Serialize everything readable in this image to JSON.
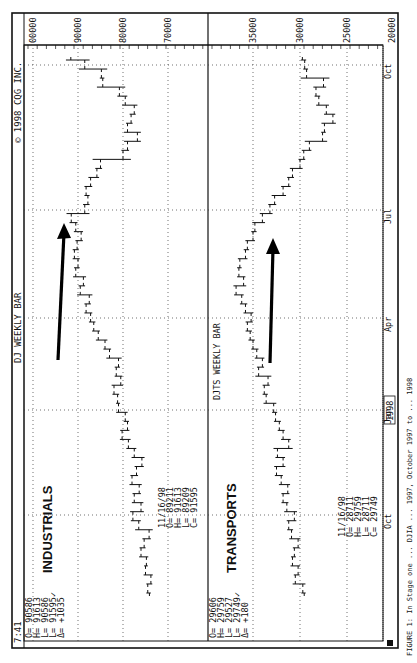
{
  "header": {
    "time": "7:41",
    "title": "DJ WEEKLY BAR",
    "copyright": "© 1998 CQG INC.",
    "industrials_quote": [
      "O= 90586",
      "H= 91613",
      "L= 90586",
      "L= 91595✓",
      "Δ= +1035"
    ],
    "transports_quote": [
      "O= 29606",
      "H= 29759",
      "L= 29527",
      "L= 29749✓",
      "Δ= +180"
    ]
  },
  "panels": {
    "industrials": {
      "label": "INDUSTRIALS",
      "date_box": [
        "11/16/98",
        "O= 89211",
        "H= 91613",
        "L= 89209",
        "C= 91595"
      ]
    },
    "transports": {
      "label": "TRANSPORTS",
      "sublabel": "DJTS WEEKLY BAR",
      "date_box": [
        "11/16/98",
        "O= 28711",
        "H= 29759",
        "L= 28711",
        "C= 29749"
      ]
    }
  },
  "caption": "FIGURE 1: In Stage one ... DJIA ... 1997, October 1997 to ... 1998",
  "chart_data": [
    {
      "type": "bar",
      "subtype": "ohlc_weekly",
      "title": "DJ WEEKLY BAR — INDUSTRIALS",
      "xlabel": "",
      "ylabel": "",
      "x_ticks": [
        "Oct",
        "Jan 1998",
        "Apr",
        "Jul",
        "Oct"
      ],
      "y_ticks": [
        100000,
        90000,
        80000,
        70000
      ],
      "ylim": [
        60000,
        102000
      ],
      "grid": true,
      "annotation": "arrow pointing up along rising trend, Apr-Jul 1998",
      "last_bar": {
        "date": "11/16/98",
        "open": 89211,
        "high": 91613,
        "low": 89209,
        "close": 91595
      },
      "weeks": 60,
      "close_series_approx": [
        74500,
        73800,
        75000,
        74800,
        76000,
        75300,
        74200,
        76500,
        77800,
        76000,
        77500,
        76400,
        78000,
        77000,
        75800,
        77500,
        78800,
        80200,
        79000,
        79500,
        81000,
        81200,
        82000,
        80500,
        81500,
        81000,
        83000,
        84000,
        85500,
        86500,
        87200,
        88200,
        87500,
        89500,
        88800,
        90500,
        90000,
        90800,
        90200,
        89300,
        90500,
        91500,
        88500,
        87800,
        88200,
        87200,
        85800,
        85000,
        80000,
        79000,
        76800,
        79000,
        78200,
        77500,
        79500,
        80800,
        84500,
        84800,
        88500,
        91595
      ]
    },
    {
      "type": "bar",
      "subtype": "ohlc_weekly",
      "title": "DJTS WEEKLY BAR — TRANSPORTS",
      "xlabel": "",
      "ylabel": "",
      "x_ticks": [
        "Oct",
        "Jan 1998",
        "Apr",
        "Jul",
        "Oct"
      ],
      "y_ticks": [
        35000,
        30000,
        25000,
        20000
      ],
      "ylim": [
        19000,
        38000
      ],
      "grid": true,
      "annotation": "arrow pointing up along rising trend, Apr-Jul 1998",
      "last_bar": {
        "date": "11/16/98",
        "open": 28711,
        "high": 29759,
        "low": 28711,
        "close": 29749
      },
      "weeks": 60,
      "close_series_approx": [
        29700,
        30500,
        30200,
        30800,
        30600,
        30200,
        30900,
        31200,
        30600,
        31400,
        31800,
        31300,
        32000,
        32500,
        31800,
        32400,
        31200,
        31800,
        32200,
        32600,
        32800,
        33600,
        33800,
        33400,
        34400,
        34000,
        34600,
        35000,
        35300,
        35600,
        35200,
        35800,
        36200,
        36800,
        36000,
        36500,
        36400,
        35800,
        35600,
        35000,
        34800,
        34000,
        33200,
        32700,
        31800,
        31200,
        30800,
        30000,
        29600,
        29000,
        27600,
        27400,
        26500,
        27200,
        28000,
        28300,
        27500,
        29300,
        29500,
        29749
      ]
    }
  ]
}
